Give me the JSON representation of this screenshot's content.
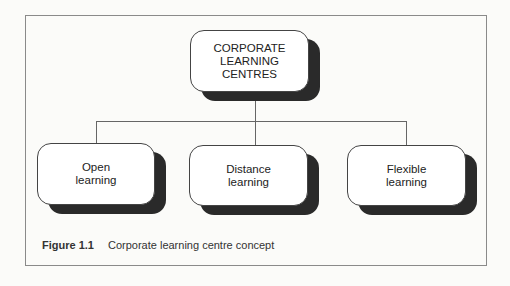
{
  "figure": {
    "root": {
      "label": "CORPORATE\nLEARNING\nCENTRES"
    },
    "children": [
      {
        "label": "Open\nlearning"
      },
      {
        "label": "Distance\nlearning"
      },
      {
        "label": "Flexible\nlearning"
      }
    ],
    "caption": {
      "number": "Figure 1.1",
      "text": "Corporate learning centre concept"
    }
  }
}
